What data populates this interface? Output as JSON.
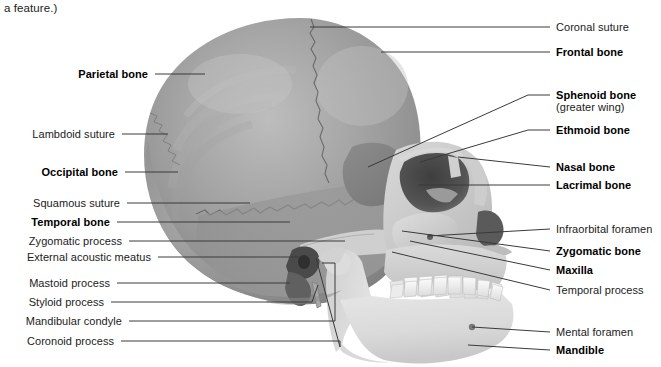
{
  "figure": {
    "caption_fragment": "a feature.)",
    "width": 661,
    "height": 367,
    "background_color": "#ffffff",
    "line_color": "#3a3a3a",
    "text_color": "#1b1b1b"
  },
  "labels_left": [
    {
      "id": "parietal-bone",
      "text": "Parietal bone",
      "bold": true,
      "text_x": 148,
      "text_y": 74,
      "line": [
        [
          155,
          74
        ],
        [
          205,
          74
        ]
      ]
    },
    {
      "id": "lambdoid-suture",
      "text": "Lambdoid suture",
      "bold": false,
      "text_x": 115,
      "text_y": 134,
      "line": [
        [
          122,
          134
        ],
        [
          168,
          134
        ]
      ]
    },
    {
      "id": "occipital-bone",
      "text": "Occipital bone",
      "bold": true,
      "text_x": 118,
      "text_y": 172,
      "line": [
        [
          125,
          172
        ],
        [
          178,
          172
        ]
      ]
    },
    {
      "id": "squamous-suture",
      "text": "Squamous suture",
      "bold": false,
      "text_x": 120,
      "text_y": 203,
      "line": [
        [
          127,
          203
        ],
        [
          250,
          203
        ]
      ]
    },
    {
      "id": "temporal-bone",
      "text": "Temporal bone",
      "bold": true,
      "text_x": 110,
      "text_y": 222,
      "line": [
        [
          117,
          222
        ],
        [
          290,
          222
        ]
      ]
    },
    {
      "id": "zygomatic-process",
      "text": "Zygomatic process",
      "bold": false,
      "text_x": 122,
      "text_y": 241,
      "line": [
        [
          129,
          241
        ],
        [
          345,
          241
        ]
      ]
    },
    {
      "id": "external-acoustic-meatus",
      "text": "External acoustic meatus",
      "bold": false,
      "text_x": 151,
      "text_y": 257,
      "line": [
        [
          158,
          257
        ],
        [
          300,
          257
        ]
      ]
    },
    {
      "id": "mastoid-process",
      "text": "Mastoid process",
      "bold": false,
      "text_x": 110,
      "text_y": 283,
      "line": [
        [
          117,
          283
        ],
        [
          290,
          283
        ]
      ]
    },
    {
      "id": "styloid-process",
      "text": "Styloid process",
      "bold": false,
      "text_x": 104,
      "text_y": 302,
      "line": [
        [
          111,
          302
        ],
        [
          300,
          302
        ]
      ]
    },
    {
      "id": "mandibular-condyle",
      "text": "Mandibular condyle",
      "bold": false,
      "text_x": 122,
      "text_y": 321,
      "line": [
        [
          129,
          321
        ],
        [
          327,
          321
        ]
      ]
    },
    {
      "id": "coronoid-process",
      "text": "Coronoid process",
      "bold": false,
      "text_x": 114,
      "text_y": 341,
      "line": [
        [
          121,
          341
        ],
        [
          333,
          341
        ]
      ]
    }
  ],
  "labels_right": [
    {
      "id": "coronal-suture",
      "text": "Coronal suture",
      "bold": false,
      "sub": "",
      "text_x": 556,
      "text_y": 27,
      "line": [
        [
          310,
          27
        ],
        [
          550,
          27
        ]
      ]
    },
    {
      "id": "frontal-bone",
      "text": "Frontal bone",
      "bold": true,
      "sub": "",
      "text_x": 556,
      "text_y": 52,
      "line": [
        [
          381,
          52
        ],
        [
          550,
          52
        ]
      ]
    },
    {
      "id": "sphenoid-bone",
      "text": "Sphenoid bone",
      "bold": true,
      "sub": "(greater wing)",
      "text_x": 556,
      "text_y": 95,
      "line": [
        [
          368,
          167
        ],
        [
          528,
          95
        ],
        [
          550,
          95
        ]
      ]
    },
    {
      "id": "ethmoid-bone",
      "text": "Ethmoid bone",
      "bold": true,
      "sub": "",
      "text_x": 556,
      "text_y": 130,
      "line": [
        [
          420,
          162
        ],
        [
          528,
          130
        ],
        [
          550,
          130
        ]
      ]
    },
    {
      "id": "nasal-bone",
      "text": "Nasal bone",
      "bold": true,
      "sub": "",
      "text_x": 556,
      "text_y": 167,
      "line": [
        [
          458,
          157
        ],
        [
          550,
          167
        ]
      ]
    },
    {
      "id": "lacrimal-bone",
      "text": "Lacrimal bone",
      "bold": true,
      "sub": "",
      "text_x": 556,
      "text_y": 185,
      "line": [
        [
          418,
          185
        ],
        [
          550,
          185
        ]
      ]
    },
    {
      "id": "infraorbital-foramen",
      "text": "Infraorbital foramen",
      "bold": false,
      "sub": "",
      "text_x": 556,
      "text_y": 229,
      "line": [
        [
          428,
          236
        ],
        [
          550,
          229
        ]
      ]
    },
    {
      "id": "zygomatic-bone",
      "text": "Zygomatic bone",
      "bold": true,
      "sub": "",
      "text_x": 556,
      "text_y": 251,
      "line": [
        [
          402,
          231
        ],
        [
          550,
          251
        ]
      ]
    },
    {
      "id": "maxilla",
      "text": "Maxilla",
      "bold": true,
      "sub": "",
      "text_x": 556,
      "text_y": 270,
      "line": [
        [
          410,
          241
        ],
        [
          550,
          270
        ]
      ]
    },
    {
      "id": "temporal-process",
      "text": "Temporal process",
      "bold": false,
      "sub": "",
      "text_x": 556,
      "text_y": 290,
      "line": [
        [
          392,
          252
        ],
        [
          550,
          290
        ]
      ]
    },
    {
      "id": "mental-foramen",
      "text": "Mental foramen",
      "bold": false,
      "sub": "",
      "text_x": 556,
      "text_y": 332,
      "line": [
        [
          472,
          327
        ],
        [
          550,
          332
        ]
      ]
    },
    {
      "id": "mandible",
      "text": "Mandible",
      "bold": true,
      "sub": "",
      "text_x": 556,
      "text_y": 350,
      "line": [
        [
          468,
          345
        ],
        [
          550,
          350
        ]
      ]
    }
  ],
  "bracket_leaders": [
    {
      "id": "mandibular-condyle-bracket",
      "points": "327,321 335,321 335,263 322,263"
    },
    {
      "id": "coronoid-process-bracket",
      "points": "333,341 340,341 340,347 316,258"
    },
    {
      "id": "styloid-process-hook",
      "points": "300,302 312,302 318,285"
    }
  ],
  "artwork": {
    "name": "human-skull-lateral-view",
    "palette": {
      "cranium_light": "#b4b4b4",
      "cranium_mid": "#969696",
      "cranium_dark": "#7e7e7e",
      "face_light": "#dcdcdc",
      "face_mid": "#c0c0c0",
      "mandible_light": "#e4e4e4",
      "tooth": "#f2f2f2",
      "cavity_dark": "#4a4a4a",
      "suture_line": "#5e5e5e"
    }
  }
}
